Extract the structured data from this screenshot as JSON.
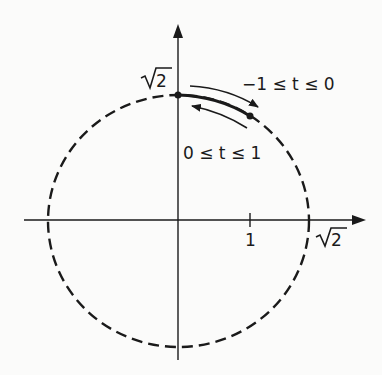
{
  "diagram": {
    "type": "parametric-circle-arc",
    "labels": {
      "y_axis_top": "2",
      "x_axis_right": "2",
      "x_tick_1": "1",
      "upper_range": "−1 ≤ t ≤ 0",
      "lower_range": "0 ≤ t ≤ 1"
    },
    "colors": {
      "ink": "#1a1a1a",
      "background": "#fbfbfa"
    }
  }
}
